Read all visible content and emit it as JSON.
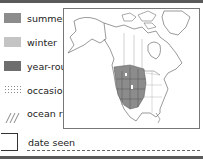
{
  "legend": {
    "items": [
      {
        "label": "summer",
        "style": "solid",
        "color": "#8c8c8c"
      },
      {
        "label": "winter",
        "style": "solid",
        "color": "#c4c4c4"
      },
      {
        "label": "year-round",
        "style": "solid",
        "color": "#6e6e6e"
      },
      {
        "label": "occasional",
        "style": "dotted",
        "color": "#9a9a9a"
      },
      {
        "label": "ocean range",
        "style": "hatched",
        "color": "#8c8c8c"
      }
    ]
  },
  "map": {
    "region": "North America",
    "range_shown": "year-round",
    "range_area": "western United States and southwestern Canada",
    "range_color": "#8c8c8c"
  },
  "date_field": {
    "label": "date seen",
    "value": ""
  }
}
